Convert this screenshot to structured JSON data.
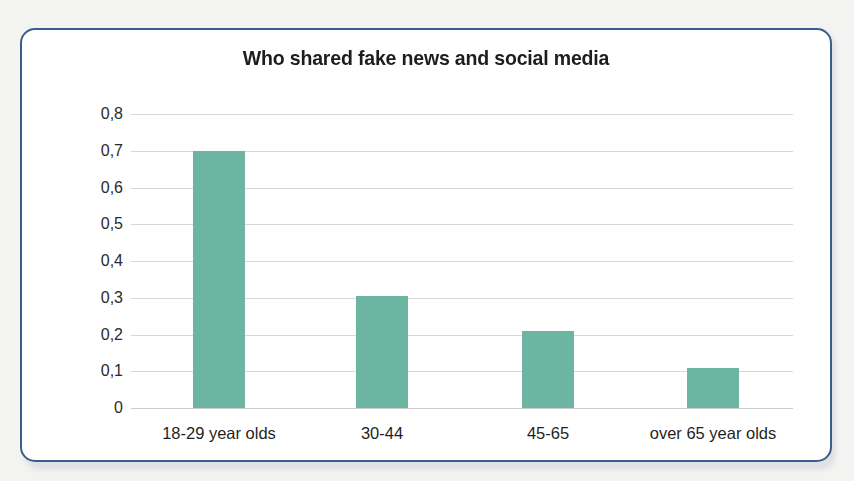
{
  "card": {
    "frame_color": "#3b5d8c",
    "background": "#ffffff"
  },
  "chart_data": {
    "type": "bar",
    "title": "Who shared fake news and social media",
    "xlabel": "",
    "ylabel": "",
    "categories": [
      "18-29 year olds",
      "30-44",
      "45-65",
      "over 65 year olds"
    ],
    "values": [
      0.7,
      0.305,
      0.21,
      0.11
    ],
    "ylim": [
      0,
      0.8
    ],
    "ytick_labels": [
      "0,8",
      "0,7",
      "0,6",
      "0,5",
      "0,4",
      "0,3",
      "0,2",
      "0,1",
      "0"
    ],
    "ytick_values": [
      0.8,
      0.7,
      0.6,
      0.5,
      0.4,
      0.3,
      0.2,
      0.1,
      0
    ],
    "grid": true,
    "legend": false,
    "bar_color": "#6cb5a3",
    "gridline_color": "#d8d8d8",
    "decimal_separator": ","
  }
}
